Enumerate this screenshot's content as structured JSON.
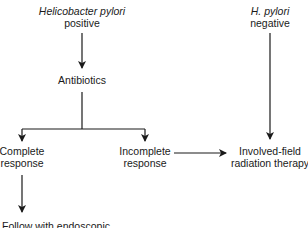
{
  "diagram": {
    "type": "flowchart",
    "nodes": {
      "hp_positive": {
        "line1": "Helicobacter pylori",
        "line2": "positive"
      },
      "antibiotics": {
        "label": "Antibiotics"
      },
      "complete": {
        "line1": "Complete",
        "line2": "response"
      },
      "incomplete": {
        "line1": "Incomplete",
        "line2": "response"
      },
      "hp_negative": {
        "line1": "H. pylori",
        "line2": "negative"
      },
      "radiation": {
        "line1": "Involved-field",
        "line2": "radiation therapy"
      },
      "followup": {
        "label": "Follow with endoscopic"
      }
    },
    "edges": [
      {
        "from": "hp_positive",
        "to": "antibiotics"
      },
      {
        "from": "antibiotics",
        "to": "complete"
      },
      {
        "from": "antibiotics",
        "to": "incomplete"
      },
      {
        "from": "incomplete",
        "to": "radiation"
      },
      {
        "from": "hp_negative",
        "to": "radiation"
      },
      {
        "from": "complete",
        "to": "followup"
      }
    ],
    "colors": {
      "line": "#1a1a1a",
      "background": "#ffffff"
    }
  }
}
